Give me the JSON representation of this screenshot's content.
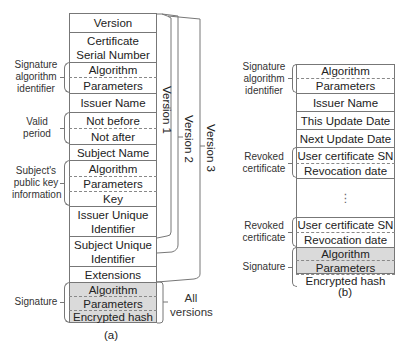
{
  "figure_a": {
    "caption": "(a)",
    "rows": [
      {
        "text": "Version"
      },
      {
        "text1": "Certificate",
        "text2": "Serial Number"
      },
      {
        "text": "Algorithm"
      },
      {
        "text": "Parameters"
      },
      {
        "text": "Issuer Name"
      },
      {
        "text": "Not before"
      },
      {
        "text": "Not after"
      },
      {
        "text": "Subject Name"
      },
      {
        "text": "Algorithm"
      },
      {
        "text": "Parameters"
      },
      {
        "text": "Key"
      },
      {
        "text1": "Issuer Unique",
        "text2": "Identifier"
      },
      {
        "text1": "Subject Unique",
        "text2": "Identifier"
      },
      {
        "text": "Extensions"
      },
      {
        "text": "Algorithm"
      },
      {
        "text": "Parameters"
      },
      {
        "text": "Encrypted hash"
      }
    ],
    "side_labels": {
      "sig_alg_id": [
        "Signature",
        "algorithm",
        "identifier"
      ],
      "valid_period": [
        "Valid",
        "period"
      ],
      "subject_pk": [
        "Subject's",
        "public key",
        "information"
      ],
      "signature": "Signature"
    },
    "versions": {
      "v1": "Version 1",
      "v2": "Version 2",
      "v3": "Version 3",
      "all": [
        "All",
        "versions"
      ]
    }
  },
  "figure_b": {
    "caption": "(b)",
    "rows": [
      {
        "text": "Algorithm"
      },
      {
        "text": "Parameters"
      },
      {
        "text": "Issuer Name"
      },
      {
        "text": "This Update Date"
      },
      {
        "text": "Next Update Date"
      },
      {
        "text": "User certificate SN"
      },
      {
        "text": "Revocation date"
      },
      {
        "text": "⋮"
      },
      {
        "text": "User certificate SN"
      },
      {
        "text": "Revocation date"
      },
      {
        "text": "Algorithm"
      },
      {
        "text": "Parameters"
      },
      {
        "text": "Encrypted hash"
      }
    ],
    "side_labels": {
      "sig_alg_id": [
        "Signature",
        "algorithm",
        "identifier"
      ],
      "revoked1": [
        "Revoked",
        "certificate"
      ],
      "revoked2": [
        "Revoked",
        "certificate"
      ],
      "signature": "Signature"
    }
  },
  "colors": {
    "line": "#777777",
    "signature_fill": "#dadada"
  }
}
